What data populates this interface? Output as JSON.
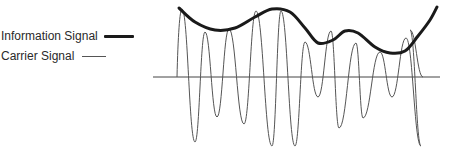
{
  "legend": {
    "information_label": "Information Signal",
    "carrier_label": "Carrier Signal"
  },
  "colors": {
    "information": "#1a1a1a",
    "carrier": "#555555",
    "axis": "#444444",
    "text": "#2a2a2a"
  },
  "axis": {
    "y": 77,
    "x_start": 153,
    "x_end": 440
  },
  "envelope_points": [
    [
      179,
      8
    ],
    [
      195,
      22
    ],
    [
      215,
      30
    ],
    [
      235,
      28
    ],
    [
      255,
      17
    ],
    [
      272,
      9
    ],
    [
      290,
      12
    ],
    [
      305,
      28
    ],
    [
      318,
      43
    ],
    [
      333,
      40
    ],
    [
      345,
      31
    ],
    [
      358,
      33
    ],
    [
      375,
      47
    ],
    [
      390,
      53
    ],
    [
      405,
      51
    ],
    [
      418,
      36
    ],
    [
      430,
      20
    ],
    [
      437,
      7
    ]
  ],
  "carrier": {
    "start": [
      177,
      77
    ],
    "peaks": [
      [
        182,
        9
      ],
      [
        205,
        32
      ],
      [
        229,
        29
      ],
      [
        256,
        11
      ],
      [
        281,
        11
      ],
      [
        305,
        42
      ],
      [
        331,
        31
      ],
      [
        356,
        43
      ],
      [
        380,
        52
      ],
      [
        406,
        38
      ],
      [
        410,
        30
      ]
    ],
    "troughs": [
      [
        195,
        142
      ],
      [
        217,
        117
      ],
      [
        244,
        124
      ],
      [
        272,
        146
      ],
      [
        295,
        146
      ],
      [
        318,
        97
      ],
      [
        339,
        128
      ],
      [
        363,
        118
      ],
      [
        392,
        97
      ],
      [
        421,
        146
      ]
    ],
    "end": [
      423,
      77
    ]
  }
}
